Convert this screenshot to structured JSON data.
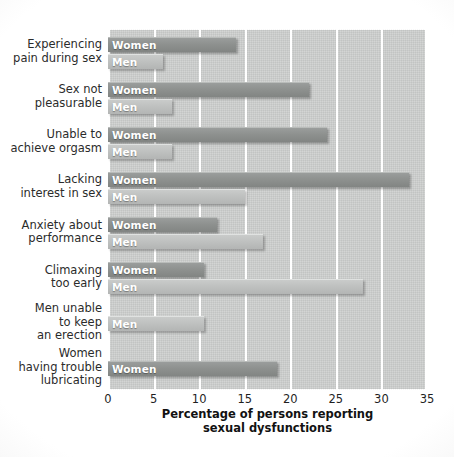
{
  "chart_data": {
    "type": "bar",
    "orientation": "horizontal",
    "title": "",
    "xlabel": "Percentage of persons reporting\nsexual dysfunctions",
    "ylabel": "",
    "xlim": [
      0,
      35
    ],
    "xticks": [
      0,
      5,
      10,
      15,
      20,
      25,
      30,
      35
    ],
    "grid": true,
    "legend": "in-bar labels",
    "series_names": [
      "Women",
      "Men"
    ],
    "categories": [
      "Experiencing\npain during sex",
      "Sex not\npleasurable",
      "Unable to\nachieve orgasm",
      "Lacking\ninterest in sex",
      "Anxiety about\nperformance",
      "Climaxing\ntoo early",
      "Men unable\nto keep\nan erection",
      "Women\nhaving trouble\nlubricating"
    ],
    "series": [
      {
        "name": "Women",
        "values": [
          14,
          22,
          24,
          33,
          12,
          10.5,
          null,
          18.5
        ]
      },
      {
        "name": "Men",
        "values": [
          6,
          7,
          7,
          15,
          17,
          28,
          10.5,
          null
        ]
      }
    ],
    "bars": [
      {
        "category": "Experiencing\npain during sex",
        "group": "Women",
        "label": "Women",
        "value": 14
      },
      {
        "category": "Experiencing\npain during sex",
        "group": "Men",
        "label": "Men",
        "value": 6
      },
      {
        "category": "Sex not\npleasurable",
        "group": "Women",
        "label": "Women",
        "value": 22
      },
      {
        "category": "Sex not\npleasurable",
        "group": "Men",
        "label": "Men",
        "value": 7
      },
      {
        "category": "Unable to\nachieve orgasm",
        "group": "Women",
        "label": "Women",
        "value": 24
      },
      {
        "category": "Unable to\nachieve orgasm",
        "group": "Men",
        "label": "Men",
        "value": 7
      },
      {
        "category": "Lacking\ninterest in sex",
        "group": "Women",
        "label": "Women",
        "value": 33
      },
      {
        "category": "Lacking\ninterest in sex",
        "group": "Men",
        "label": "Men",
        "value": 15
      },
      {
        "category": "Anxiety about\nperformance",
        "group": "Women",
        "label": "Women",
        "value": 12
      },
      {
        "category": "Anxiety about\nperformance",
        "group": "Men",
        "label": "Men",
        "value": 17
      },
      {
        "category": "Climaxing\ntoo early",
        "group": "Women",
        "label": "Women",
        "value": 10.5
      },
      {
        "category": "Climaxing\ntoo early",
        "group": "Men",
        "label": "Men",
        "value": 28
      },
      {
        "category": "Men unable\nto keep\nan erection",
        "group": "Men",
        "label": "Men",
        "value": 10.5
      },
      {
        "category": "Women\nhaving trouble\nlubricating",
        "group": "Women",
        "label": "Women",
        "value": 18.5
      }
    ],
    "colors": {
      "women_bar": "#8e918f",
      "men_bar": "#bfc1c0",
      "plot_background": "#cfd1d0",
      "gridline": "#ffffff",
      "text": "#2b2b2b",
      "page_background": "#ffffff"
    }
  }
}
